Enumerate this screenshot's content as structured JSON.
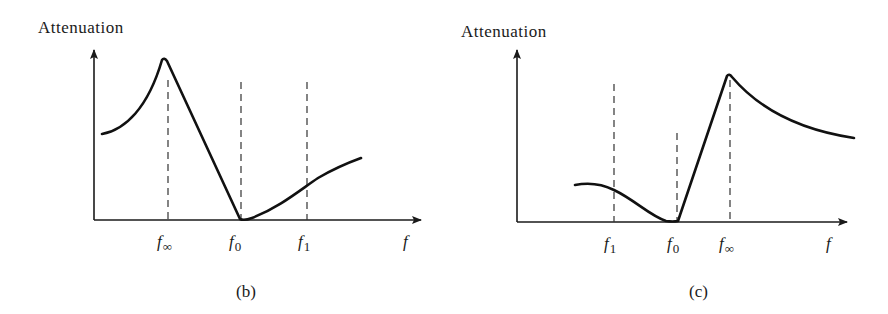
{
  "diagrams": [
    {
      "id": "b",
      "caption": "(b)",
      "y_axis_label": "Attenuation",
      "x_axis_label": "f",
      "markers": [
        {
          "base": "f",
          "sub": "∞",
          "name": "f-infinity"
        },
        {
          "base": "f",
          "sub": "0",
          "name": "f-zero"
        },
        {
          "base": "f",
          "sub": "1",
          "name": "f-one"
        }
      ],
      "description": "Attenuation rises to a pole peak at f∞, falls linearly to zero at f0, then rises gradually past f1"
    },
    {
      "id": "c",
      "caption": "(c)",
      "y_axis_label": "Attenuation",
      "x_axis_label": "f",
      "markers": [
        {
          "base": "f",
          "sub": "1",
          "name": "f-one"
        },
        {
          "base": "f",
          "sub": "0",
          "name": "f-zero"
        },
        {
          "base": "f",
          "sub": "∞",
          "name": "f-infinity"
        }
      ],
      "description": "Attenuation starts low, decreases through f1 to zero at f0, rises linearly to a pole peak at f∞, then decays"
    }
  ],
  "colors": {
    "ink": "#1a1a1a",
    "background": "#ffffff"
  }
}
